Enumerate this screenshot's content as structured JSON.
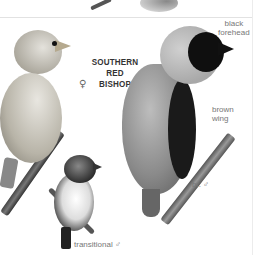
{
  "plate": {
    "species_title": "SOUTHERN RED BISHOP",
    "title_line1": "SOUTHERN RED",
    "title_line2": "BISHOP",
    "labels": {
      "female_symbol": "♀",
      "black_forehead": "black forehead",
      "black_forehead_line1": "black",
      "black_forehead_line2": "forehead",
      "brown_wing_line1": "brown",
      "brown_wing_line2": "wing",
      "breeding_male": "br. ♂",
      "transitional_male": "transitional ♂"
    },
    "illustrations": [
      {
        "name": "female",
        "symbol": "♀"
      },
      {
        "name": "breeding male",
        "label": "br. ♂"
      },
      {
        "name": "transitional male",
        "label": "transitional ♂"
      }
    ]
  },
  "colors": {
    "background": "#ffffff",
    "title_text": "#333333",
    "label_text": "#777777",
    "divider": "#e2e2e2"
  }
}
